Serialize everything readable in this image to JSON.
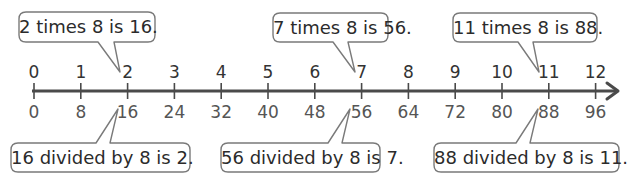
{
  "diagram": {
    "type": "double_number_line",
    "line_color": "#4a4a4a",
    "bubble_border_color": "#7a7a7a",
    "top_labels": [
      "0",
      "1",
      "2",
      "3",
      "4",
      "5",
      "6",
      "7",
      "8",
      "9",
      "10",
      "11",
      "12"
    ],
    "bottom_labels": [
      "0",
      "8",
      "16",
      "24",
      "32",
      "40",
      "48",
      "56",
      "64",
      "72",
      "80",
      "88",
      "96"
    ],
    "callouts_top": [
      {
        "text": "2 times 8 is 16.",
        "points_to": "2"
      },
      {
        "text": "7 times 8 is 56.",
        "points_to": "7"
      },
      {
        "text": "11 times 8 is 88.",
        "points_to": "11"
      }
    ],
    "callouts_bottom": [
      {
        "text": "16 divided by 8 is 2.",
        "points_to": "16"
      },
      {
        "text": "56 divided by 8 is 7.",
        "points_to": "56"
      },
      {
        "text": "88 divided by 8 is 11.",
        "points_to": "88"
      }
    ]
  }
}
